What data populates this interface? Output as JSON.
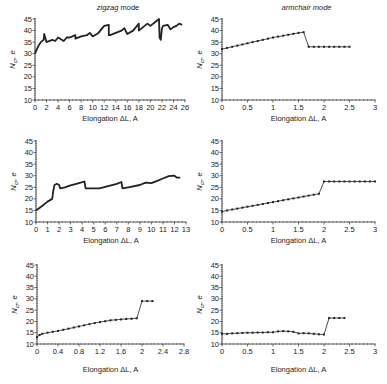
{
  "chart_data": [
    {
      "type": "line",
      "panel": "top-left",
      "title": "zigzag mode",
      "xlabel": "Elongation ΔL, A",
      "ylabel": "N_cr, e",
      "xlim": [
        0,
        26
      ],
      "ylim": [
        10,
        45
      ],
      "xticks": [
        0,
        2,
        4,
        6,
        8,
        10,
        12,
        14,
        16,
        18,
        20,
        22,
        24,
        26
      ],
      "xtick_labels": [
        "0",
        "2",
        "4",
        "6",
        "8",
        "10",
        "12",
        "14",
        "16",
        "18",
        "20",
        "22",
        "24",
        "26"
      ],
      "yticks": [
        10,
        15,
        20,
        25,
        30,
        35,
        40,
        45
      ],
      "markers": false,
      "series": [
        {
          "name": "zigzag-1",
          "x": [
            0,
            0.5,
            1,
            1.5,
            1.6,
            2,
            3,
            3.5,
            4,
            5,
            5.5,
            6,
            7,
            7,
            8,
            9,
            9.5,
            10,
            11,
            11.5,
            12,
            12.8,
            12.8,
            13,
            14,
            15,
            15.5,
            16,
            17,
            17.5,
            18,
            18,
            19,
            19.5,
            20,
            21,
            21.5,
            21.6,
            21.8,
            22,
            22.2,
            23,
            23.5,
            24,
            24.5,
            25,
            25.5
          ],
          "y": [
            30,
            33,
            35,
            36,
            38.5,
            35,
            36,
            35.5,
            37,
            35.5,
            37,
            37,
            38,
            36.5,
            37.5,
            38,
            39,
            37.5,
            39,
            40.5,
            42,
            42.5,
            38,
            38,
            39,
            40,
            41,
            38.5,
            40,
            41.5,
            43,
            40,
            42,
            43,
            42,
            44,
            45,
            37,
            36,
            41,
            42,
            42.5,
            40.5,
            41.5,
            42,
            43,
            42.5
          ]
        }
      ]
    },
    {
      "type": "line",
      "panel": "top-right",
      "title": "armchair mode",
      "xlabel": "Elongation ΔL, A",
      "ylabel": "N_cr, e",
      "xlim": [
        0,
        3
      ],
      "ylim": [
        10,
        45
      ],
      "xticks": [
        0,
        0.5,
        1,
        1.5,
        2,
        2.5,
        3
      ],
      "xtick_labels": [
        "0",
        "0.5",
        "1",
        "1.5",
        "2",
        "2.5",
        "3"
      ],
      "yticks": [
        10,
        15,
        20,
        25,
        30,
        35,
        40,
        45
      ],
      "markers": true,
      "series": [
        {
          "name": "armchair-1",
          "x": [
            0,
            0.1,
            0.2,
            0.3,
            0.4,
            0.5,
            0.6,
            0.7,
            0.8,
            0.9,
            1.0,
            1.1,
            1.2,
            1.3,
            1.4,
            1.5,
            1.6,
            1.7,
            1.8,
            1.9,
            2.0,
            2.1,
            2.2,
            2.3,
            2.4,
            2.5
          ],
          "y": [
            32,
            32.5,
            33,
            33.5,
            34,
            34.5,
            35,
            35.5,
            36,
            36.5,
            37,
            37.4,
            37.8,
            38.2,
            38.6,
            39,
            39.3,
            33,
            33,
            33,
            33,
            33,
            33,
            33,
            33,
            33
          ]
        }
      ]
    },
    {
      "type": "line",
      "panel": "middle-left",
      "title": "",
      "xlabel": "Elongation ΔL, A",
      "ylabel": "N_cr, e",
      "xlim": [
        0,
        13
      ],
      "ylim": [
        10,
        45
      ],
      "xticks": [
        0,
        1,
        2,
        3,
        4,
        5,
        6,
        7,
        8,
        9,
        10,
        11,
        12,
        13
      ],
      "xtick_labels": [
        "0",
        "1",
        "2",
        "3",
        "4",
        "5",
        "6",
        "7",
        "8",
        "9",
        "10",
        "11",
        "12",
        "13"
      ],
      "yticks": [
        10,
        15,
        20,
        25,
        30,
        35,
        40,
        45
      ],
      "markers": false,
      "series": [
        {
          "name": "zigzag-2",
          "x": [
            0,
            0.5,
            1,
            1.4,
            1.5,
            1.6,
            1.8,
            2,
            2.1,
            2.5,
            3,
            3.5,
            4,
            4.2,
            4.3,
            5,
            5.5,
            6,
            7,
            7.4,
            7.5,
            8,
            9,
            9.5,
            10,
            10.5,
            11,
            11.5,
            12,
            12.2,
            12.5
          ],
          "y": [
            15,
            16.8,
            18.8,
            20,
            23.5,
            26,
            26.5,
            26,
            24.5,
            25,
            25.8,
            26.5,
            27.2,
            27.5,
            24.5,
            24.5,
            24.5,
            25.2,
            26.5,
            27.3,
            24.5,
            25,
            26,
            27,
            26.8,
            27.8,
            28.8,
            29.8,
            30,
            29.2,
            29.2
          ]
        }
      ]
    },
    {
      "type": "line",
      "panel": "middle-right",
      "title": "",
      "xlabel": "Elongation ΔL, A",
      "ylabel": "N_cr, e",
      "xlim": [
        0,
        3
      ],
      "ylim": [
        10,
        45
      ],
      "xticks": [
        0,
        0.5,
        1,
        1.5,
        2,
        2.5,
        3
      ],
      "xtick_labels": [
        "0",
        "0.5",
        "1",
        "1.5",
        "2",
        "2.5",
        "3"
      ],
      "yticks": [
        10,
        15,
        20,
        25,
        30,
        35,
        40,
        45
      ],
      "markers": true,
      "series": [
        {
          "name": "armchair-2",
          "x": [
            0,
            0.1,
            0.2,
            0.3,
            0.4,
            0.5,
            0.6,
            0.7,
            0.8,
            0.9,
            1.0,
            1.1,
            1.2,
            1.3,
            1.4,
            1.5,
            1.6,
            1.7,
            1.8,
            1.9,
            2.0,
            2.1,
            2.2,
            2.3,
            2.4,
            2.5,
            2.6,
            2.7,
            2.8,
            2.9,
            3.0
          ],
          "y": [
            14.5,
            15,
            15.4,
            15.8,
            16.2,
            16.6,
            17,
            17.4,
            17.8,
            18.2,
            18.6,
            19,
            19.4,
            19.8,
            20.2,
            20.6,
            21,
            21.4,
            21.8,
            22.2,
            27.5,
            27.5,
            27.5,
            27.5,
            27.5,
            27.5,
            27.5,
            27.5,
            27.5,
            27.5,
            27.5
          ]
        }
      ]
    },
    {
      "type": "line",
      "panel": "bottom-left",
      "title": "",
      "xlabel": "Elongation ΔL, A",
      "ylabel": "N_cr, e",
      "xlim": [
        0,
        2.8
      ],
      "ylim": [
        10,
        45
      ],
      "xticks": [
        0,
        0.4,
        0.8,
        1.2,
        1.6,
        2,
        2.4,
        2.8
      ],
      "xtick_labels": [
        "0",
        "0.4",
        "0.8",
        "1.2",
        "1.6",
        "2",
        "2.4",
        "2.8"
      ],
      "yticks": [
        10,
        15,
        20,
        25,
        30,
        35,
        40,
        45
      ],
      "markers": true,
      "series": [
        {
          "name": "zigzag-3",
          "x": [
            0,
            0.05,
            0.1,
            0.2,
            0.3,
            0.4,
            0.5,
            0.6,
            0.7,
            0.8,
            0.9,
            1.0,
            1.1,
            1.2,
            1.3,
            1.4,
            1.5,
            1.6,
            1.7,
            1.8,
            1.9,
            2.0,
            2.1,
            2.2
          ],
          "y": [
            13,
            14,
            14.5,
            15,
            15.4,
            15.8,
            16.3,
            16.8,
            17.3,
            17.8,
            18.3,
            18.8,
            19.3,
            19.7,
            20.1,
            20.5,
            20.7,
            20.9,
            21.1,
            21.2,
            21.4,
            29,
            29,
            29
          ]
        }
      ]
    },
    {
      "type": "line",
      "panel": "bottom-right",
      "title": "",
      "xlabel": "Elongation ΔL, A",
      "ylabel": "N_cr, e",
      "xlim": [
        0,
        3
      ],
      "ylim": [
        10,
        45
      ],
      "xticks": [
        0,
        0.5,
        1,
        1.5,
        2,
        2.5,
        3
      ],
      "xtick_labels": [
        "0",
        "0.5",
        "1",
        "1.5",
        "2",
        "2.5",
        "3"
      ],
      "yticks": [
        10,
        15,
        20,
        25,
        30,
        35,
        40,
        45
      ],
      "markers": true,
      "series": [
        {
          "name": "armchair-3",
          "x": [
            0,
            0.1,
            0.2,
            0.3,
            0.4,
            0.5,
            0.6,
            0.7,
            0.8,
            0.9,
            1.0,
            1.1,
            1.2,
            1.3,
            1.4,
            1.5,
            1.6,
            1.7,
            1.8,
            1.9,
            2.0,
            2.1,
            2.2,
            2.3,
            2.4
          ],
          "y": [
            14.5,
            14.5,
            14.7,
            14.8,
            14.9,
            15,
            15,
            15.1,
            15.1,
            15.2,
            15.2,
            15.6,
            15.7,
            15.6,
            15.4,
            14.7,
            14.8,
            14.7,
            14.5,
            14.3,
            14.2,
            21.5,
            21.5,
            21.5,
            21.5
          ]
        }
      ]
    }
  ]
}
